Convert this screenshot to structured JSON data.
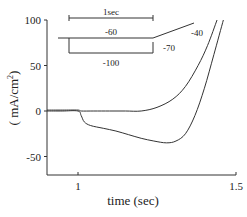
{
  "chart_data": {
    "type": "line",
    "title": "",
    "xlabel": "time (sec)",
    "ylabel": "( mA/cm²)",
    "ylabel_main": "( mA/cm",
    "ylabel_sup": "2",
    "ylabel_close": ")",
    "xlim": [
      0.9,
      1.52
    ],
    "ylim": [
      -70,
      100
    ],
    "xticks": [
      {
        "value": 1,
        "label": "1"
      },
      {
        "value": 1.5,
        "label": "1.5"
      }
    ],
    "yticks": [
      {
        "value": 100,
        "label": "100"
      },
      {
        "value": 50,
        "label": "50"
      },
      {
        "value": 0,
        "label": "0"
      },
      {
        "value": -50,
        "label": "-50"
      }
    ],
    "grid": false,
    "series": [
      {
        "name": "step to -60 then -40",
        "x": [
          0.9,
          0.95,
          1.0,
          1.01,
          1.05,
          1.1,
          1.15,
          1.2,
          1.25,
          1.3,
          1.34,
          1.38,
          1.41,
          1.44
        ],
        "y": [
          1,
          1,
          1,
          0,
          0,
          0,
          0,
          0,
          4,
          13,
          27,
          50,
          72,
          100
        ]
      },
      {
        "name": "step to -100 then -70",
        "x": [
          0.9,
          0.95,
          1.0,
          1.01,
          1.02,
          1.04,
          1.08,
          1.12,
          1.16,
          1.2,
          1.24,
          1.28,
          1.31,
          1.34,
          1.37,
          1.4,
          1.43,
          1.46
        ],
        "y": [
          0,
          0,
          0,
          -5,
          -12,
          -16,
          -19,
          -22,
          -26,
          -30,
          -33,
          -35,
          -33,
          -25,
          -5,
          25,
          62,
          100
        ]
      }
    ],
    "inset": {
      "scale_bar_label": "1sec",
      "protocol_labels": {
        "hold": "-60",
        "step": "-100",
        "post_low": "-70",
        "post_high": "-40"
      }
    }
  }
}
